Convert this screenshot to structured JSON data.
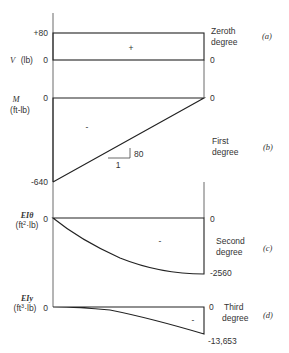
{
  "diagram": {
    "panels": [
      {
        "id": "a",
        "tag": "(a)",
        "axis_label": "V (lb)",
        "axis_symbol": "V",
        "axis_unit": "(lb)",
        "left_top_value": "+80",
        "left_bottom_value": "0",
        "right_value": "0",
        "sign": "+",
        "degree_line1": "Zeroth",
        "degree_line2": "degree"
      },
      {
        "id": "b",
        "tag": "(b)",
        "axis_symbol": "M",
        "axis_unit": "(ft-lb)",
        "left_top_value": "0",
        "left_bottom_value": "-640",
        "right_value": "0",
        "sign": "-",
        "slope_rise": "80",
        "slope_run": "1",
        "degree_line1": "First",
        "degree_line2": "degree"
      },
      {
        "id": "c",
        "tag": "(c)",
        "axis_symbol": "EIθ",
        "axis_unit_base": "(ft",
        "axis_unit_sup": "2",
        "axis_unit_tail": "·lb)",
        "left_value": "0",
        "right_top_value": "0",
        "right_bottom_value": "-2560",
        "sign": "-",
        "degree_line1": "Second",
        "degree_line2": "degree"
      },
      {
        "id": "d",
        "tag": "(d)",
        "axis_symbol": "EIy",
        "axis_unit_base": "(ft",
        "axis_unit_sup": "3",
        "axis_unit_tail": "·lb)",
        "left_value": "0",
        "right_top_value": "0",
        "right_bottom_value": "-13,653",
        "sign": "-",
        "degree_line1": "Third",
        "degree_line2": "degree"
      }
    ]
  }
}
